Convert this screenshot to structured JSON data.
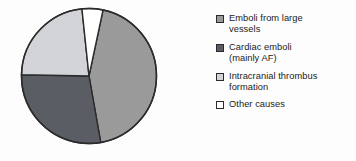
{
  "chart_data": {
    "type": "pie",
    "title": "",
    "subtitle": "",
    "xlabel": "",
    "ylabel": "",
    "legend_position": "right",
    "grid": false,
    "categories": [
      "Emboli from large vessels",
      "Cardiac emboli (mainly AF)",
      "Intracranial thrombus formation",
      "Other causes"
    ],
    "values": [
      44,
      28,
      23,
      5
    ],
    "units": "percent",
    "start_angle_deg": 12,
    "direction": "clockwise",
    "slices": [
      {
        "label": "Emboli from large vessels",
        "value": 44,
        "color": "#9a9a9a",
        "start_deg": 12,
        "end_deg": 170
      },
      {
        "label": "Cardiac emboli (mainly AF)",
        "value": 28,
        "color": "#5a5d63",
        "start_deg": 170,
        "end_deg": 271
      },
      {
        "label": "Intracranial thrombus formation",
        "value": 23,
        "color": "#d2d4d8",
        "start_deg": 271,
        "end_deg": 354
      },
      {
        "label": "Other causes",
        "value": 5,
        "color": "#ffffff",
        "start_deg": 354,
        "end_deg": 372
      }
    ]
  },
  "legend": {
    "items": [
      {
        "label": "Emboli from large\nvessels",
        "color": "#9a9a9a",
        "swatch_name": "legend-swatch-emboli-large-vessels"
      },
      {
        "label": "Cardiac emboli\n(mainly AF)",
        "color": "#5a5d63",
        "swatch_name": "legend-swatch-cardiac-emboli"
      },
      {
        "label": "Intracranial thrombus\nformation",
        "color": "#d2d4d8",
        "swatch_name": "legend-swatch-intracranial-thrombus"
      },
      {
        "label": "Other causes",
        "color": "#ffffff",
        "swatch_name": "legend-swatch-other-causes"
      }
    ]
  },
  "style": {
    "background": "#fdfdfd",
    "outline": "#2b2b2b",
    "text": "#1b1b1b"
  }
}
